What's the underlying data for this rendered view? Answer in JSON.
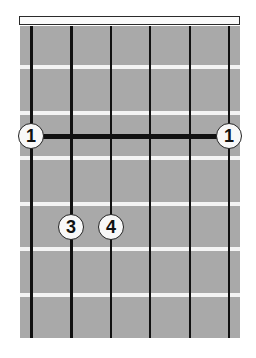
{
  "diagram": {
    "type": "guitar-chord-chart",
    "strings": 6,
    "frets_shown": 7,
    "colors": {
      "board": "#a9a9a9",
      "fret": "#f4f4f4",
      "string": "#111111",
      "nut": "#fafafa",
      "finger_fill": "#f8f8f8"
    },
    "string_x": [
      31,
      71,
      111,
      150,
      190,
      229
    ],
    "fret_y": [
      67,
      113,
      158,
      204,
      249,
      295
    ],
    "barre": {
      "fret": 3,
      "from_string": 1,
      "to_string": 6,
      "y": 136
    },
    "fingers": [
      {
        "label": "1",
        "string": 1,
        "fret": 3,
        "x": 31,
        "y": 136
      },
      {
        "label": "1",
        "string": 6,
        "fret": 3,
        "x": 229,
        "y": 136
      },
      {
        "label": "3",
        "string": 2,
        "fret": 5,
        "x": 71,
        "y": 227
      },
      {
        "label": "4",
        "string": 3,
        "fret": 5,
        "x": 111,
        "y": 227
      }
    ]
  }
}
